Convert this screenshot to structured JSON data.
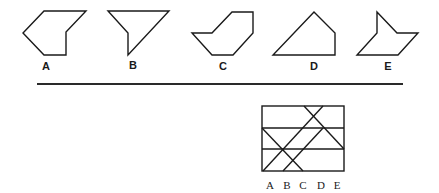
{
  "options": [
    {
      "label": "A",
      "points": "44,11 86,11 66,32 66,55 44,55 23,33",
      "label_x": 46,
      "label_y": 70
    },
    {
      "label": "B",
      "points": "108,11 169,11 128,55 128,33",
      "label_x": 133,
      "label_y": 69
    },
    {
      "label": "C",
      "points": "232,12 253,12 253,33 233,55 212,55 192,33 212,33",
      "label_x": 223,
      "label_y": 70
    },
    {
      "label": "D",
      "points": "314,12 335,33 335,55 273,55",
      "label_x": 314,
      "label_y": 70
    },
    {
      "label": "E",
      "points": "377,12 397,33 418,33 398,55 357,55 377,33",
      "label_x": 388,
      "label_y": 70
    }
  ],
  "divider": {
    "x1": 37,
    "y1": 84,
    "x2": 403,
    "y2": 84
  },
  "grid_figure": {
    "rect": {
      "x": 262,
      "y": 106,
      "width": 82,
      "height": 65
    },
    "horizontal_lines_y": [
      128,
      149
    ],
    "diagonals": [
      {
        "x1": 262,
        "y1": 128,
        "x2": 303,
        "y2": 171
      },
      {
        "x1": 263,
        "y1": 171,
        "x2": 323,
        "y2": 106
      },
      {
        "x1": 283,
        "y1": 171,
        "x2": 323,
        "y2": 128
      },
      {
        "x1": 304,
        "y1": 106,
        "x2": 344,
        "y2": 149
      }
    ],
    "labels": [
      {
        "text": "A",
        "x": 270
      },
      {
        "text": "B",
        "x": 287
      },
      {
        "text": "C",
        "x": 303
      },
      {
        "text": "D",
        "x": 321
      },
      {
        "text": "E",
        "x": 337
      }
    ],
    "labels_y": 189
  }
}
